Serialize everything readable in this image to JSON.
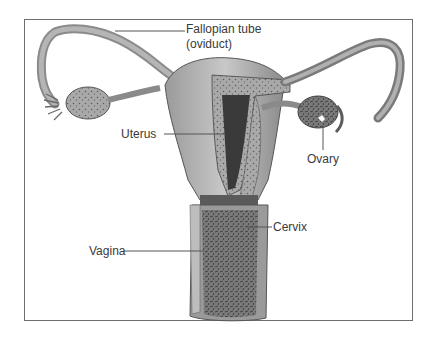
{
  "figure": {
    "labels": {
      "fallopian_tube_line1": "Fallopian tube",
      "fallopian_tube_line2": "(oviduct)",
      "uterus": "Uterus",
      "ovary": "Ovary",
      "cervix": "Cervix",
      "vagina": "Vagina"
    },
    "colors": {
      "frame": "#6e6e6e",
      "tissue_light": "#b8b8b8",
      "tissue_mid": "#8c8c8c",
      "tissue_dark": "#4a4a4a",
      "leader_line": "#555555"
    }
  }
}
